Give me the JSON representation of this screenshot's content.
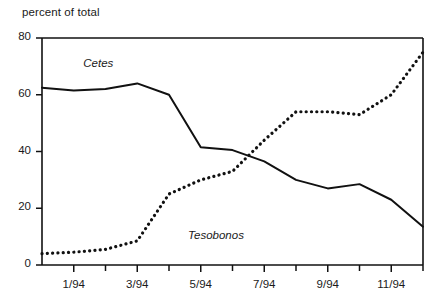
{
  "chart_data": {
    "type": "line",
    "title": "",
    "subtitle": "",
    "ylabel": "percent of total",
    "xlabel": "",
    "ylim": [
      0,
      80
    ],
    "yticks": [
      0,
      20,
      40,
      60,
      80
    ],
    "ytick_labels": [
      "0",
      "20",
      "40",
      "60",
      "80"
    ],
    "grid": false,
    "legend_position": "inline-annotation",
    "x": [
      "12/93",
      "1/94",
      "2/94",
      "3/94",
      "4/94",
      "5/94",
      "6/94",
      "7/94",
      "8/94",
      "9/94",
      "10/94",
      "11/94",
      "12/94"
    ],
    "xtick_labels": [
      "1/94",
      "3/94",
      "5/94",
      "7/94",
      "9/94",
      "11/94"
    ],
    "xtick_label_index": [
      1,
      3,
      5,
      7,
      9,
      11
    ],
    "series": [
      {
        "name": "Cetes",
        "style": "solid",
        "color": "#111111",
        "values": [
          62.5,
          61.5,
          62.0,
          64.0,
          60.0,
          41.5,
          40.5,
          36.5,
          30.0,
          27.0,
          28.5,
          23.0,
          13.5
        ]
      },
      {
        "name": "Tesobonos",
        "style": "dotted",
        "color": "#111111",
        "values": [
          4.0,
          4.5,
          5.5,
          8.5,
          25.0,
          30.0,
          33.0,
          44.0,
          54.0,
          54.0,
          53.0,
          60.0,
          75.0
        ]
      }
    ],
    "annotations": [
      {
        "text": "Cetes",
        "x_index": 1.3,
        "y": 70.5
      },
      {
        "text": "Tesobonos",
        "x_index": 4.6,
        "y": 10.0
      }
    ]
  }
}
